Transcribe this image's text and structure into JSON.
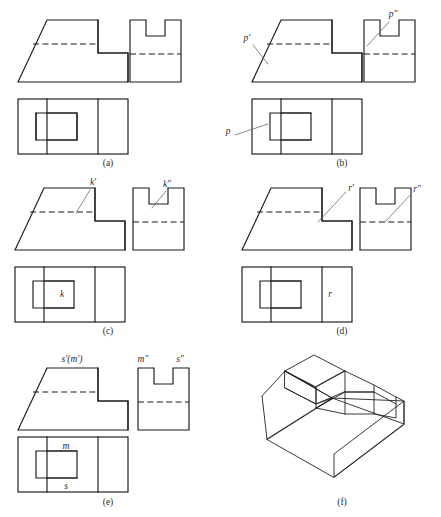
{
  "sheet": {
    "title_alt": "Orthographic three-view projection exercise with point labels",
    "stroke_color": "#1a1a1a",
    "leader_color": "#6b6b6b",
    "background": "#ffffff"
  },
  "panels": [
    {
      "id": "a",
      "caption": "(a)",
      "caption_x": 108,
      "caption_y": 166,
      "labels": []
    },
    {
      "id": "b",
      "caption": "(b)",
      "caption_x": 342,
      "caption_y": 166,
      "labels": [
        {
          "text": "p'",
          "x": 247,
          "y": 41,
          "view": "front"
        },
        {
          "text": "p\"",
          "x": 392,
          "y": 16,
          "view": "side"
        },
        {
          "text": "p",
          "x": 228,
          "y": 132,
          "view": "top"
        }
      ]
    },
    {
      "id": "c",
      "caption": "(c)",
      "caption_x": 108,
      "caption_y": 334,
      "labels": [
        {
          "text": "k'",
          "x": 92,
          "y": 185,
          "view": "front"
        },
        {
          "text": "k\"",
          "x": 164,
          "y": 186,
          "view": "side"
        },
        {
          "text": "k",
          "x": 64,
          "y": 294,
          "view": "top"
        }
      ]
    },
    {
      "id": "d",
      "caption": "(d)",
      "caption_x": 342,
      "caption_y": 334,
      "labels": [
        {
          "text": "r'",
          "x": 337,
          "y": 192,
          "view": "front"
        },
        {
          "text": "r\"",
          "x": 417,
          "y": 192,
          "view": "side"
        },
        {
          "text": "r",
          "x": 324,
          "y": 296,
          "view": "top"
        }
      ]
    },
    {
      "id": "e",
      "caption": "(e)",
      "caption_x": 108,
      "caption_y": 505,
      "labels": [
        {
          "text": "s'(m')",
          "x": 56,
          "y": 360,
          "view": "front"
        },
        {
          "text": "m\"",
          "x": 134,
          "y": 360,
          "view": "side"
        },
        {
          "text": "s\"",
          "x": 177,
          "y": 360,
          "view": "side"
        },
        {
          "text": "m",
          "x": 66,
          "y": 455,
          "view": "top"
        },
        {
          "text": "s",
          "x": 68,
          "y": 489,
          "view": "top"
        }
      ]
    },
    {
      "id": "f",
      "caption": "(f)",
      "caption_x": 342,
      "caption_y": 505,
      "labels": []
    }
  ],
  "views": {
    "front_view_name": "front-view-outline",
    "side_view_name": "side-view-outline",
    "top_view_name": "top-view-outline",
    "isometric_name": "isometric-pictorial"
  },
  "geometry": {
    "front_outline_desc": "Trapezoid with stepped right side: inclined left face, flat top, step down to lower right platform",
    "side_outline_desc": "Rectangle with rectangular notch cut from top center",
    "top_outline_desc": "Rectangle divided into nested rectangles showing slot and platform boundaries",
    "hidden_line_front_desc": "Horizontal dashed line across upper portion marking hidden edge of slot bottom",
    "hidden_line_side_desc": "Horizontal dashed line across middle marking hidden edge of inclined face"
  }
}
